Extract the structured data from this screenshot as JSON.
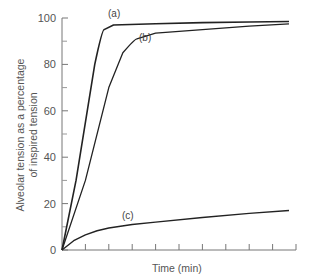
{
  "chart_data": {
    "type": "line",
    "title": "",
    "xlabel": "Time (min)",
    "ylabel": "Alveolar tension as a percentage of inspired tension",
    "ylabel_lines": [
      "Alveolar tension as a percentage",
      "of inspired tension"
    ],
    "ylim": [
      0,
      100
    ],
    "yticks": [
      0,
      20,
      40,
      60,
      80,
      100
    ],
    "ytick_labels": [
      "0",
      "20",
      "40",
      "60",
      "80",
      "100"
    ],
    "y_minor_ticks": [
      10,
      30,
      50,
      70,
      90
    ],
    "xticks_count": 10,
    "xtick_labels": [],
    "grid": false,
    "legend": "inline labels",
    "series": [
      {
        "name": "(a)",
        "label": "(a)",
        "x": [
          0,
          0.6,
          1.4,
          1.8,
          2.2,
          4,
          6,
          8,
          9.7
        ],
        "values": [
          0,
          30,
          80,
          95,
          97,
          97.5,
          98,
          98.3,
          98.5
        ]
      },
      {
        "name": "(b)",
        "label": "(b)",
        "x": [
          0,
          1,
          2,
          2.6,
          3.2,
          4,
          6,
          8,
          9.7
        ],
        "values": [
          0,
          30,
          70,
          85,
          91,
          93.5,
          95,
          96.5,
          97.5
        ]
      },
      {
        "name": "(c)",
        "label": "(c)",
        "x": [
          0,
          0.5,
          1,
          1.5,
          2,
          3,
          4,
          6,
          8,
          9.7
        ],
        "values": [
          0,
          4,
          6.5,
          8.3,
          9.5,
          11,
          12,
          14,
          15.8,
          17
        ]
      }
    ]
  }
}
